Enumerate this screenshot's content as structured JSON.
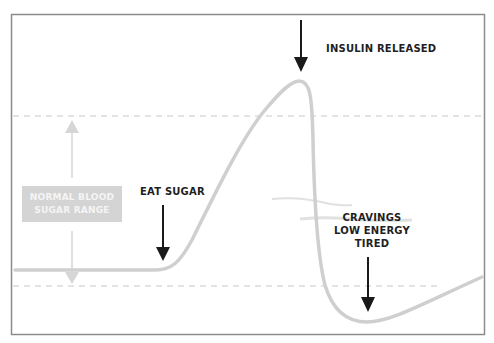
{
  "diagram": {
    "title_partial": "",
    "labels": {
      "insulin_released": "INSULIN RELEASED",
      "eat_sugar": "EAT SUGAR",
      "crash_line1": "CRAVINGS",
      "crash_line2": "LOW ENERGY",
      "crash_line3": "TIRED",
      "range_line1": "NORMAL BLOOD",
      "range_line2": "SUGAR RANGE"
    },
    "colors": {
      "curve": "#cfcfcf",
      "frame": "#8c8c8c",
      "dashed": "#c8c8c8",
      "arrow": "#1a1a1a",
      "range_box": "#d4d4d4",
      "range_arrow": "#d6d6d6"
    },
    "curve_description": "Blood sugar level over time: flat baseline, spike after eating sugar, peak when insulin released, sharp crash below normal range, slow recovery"
  }
}
